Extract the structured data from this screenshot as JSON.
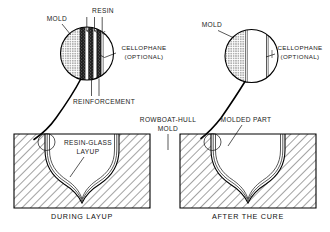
{
  "figure": {
    "panels": [
      {
        "id": "during-layup",
        "caption": "DURING LAYUP",
        "callouts": [
          {
            "name": "mold",
            "text": "MOLD"
          },
          {
            "name": "resin",
            "text": "RESIN"
          },
          {
            "name": "cellophane",
            "line1": "CELLOPHANE",
            "line2": "(OPTIONAL)"
          },
          {
            "name": "reinforcement",
            "text": "REINFORCEMENT"
          },
          {
            "name": "resin-glass-layup",
            "line1": "RESIN-GLASS",
            "line2": "LAYUP"
          }
        ],
        "detail_layers": [
          "mold",
          "reinforcement",
          "resin",
          "reinforcement",
          "resin",
          "cellophane"
        ],
        "resin_arrow_count": 3
      },
      {
        "id": "after-the-cure",
        "caption": "AFTER THE CURE",
        "callouts": [
          {
            "name": "mold",
            "text": "MOLD"
          },
          {
            "name": "cellophane",
            "line1": "CELLOPHANE",
            "line2": "(OPTIONAL)"
          },
          {
            "name": "molded-part",
            "text": "MOLDED PART"
          },
          {
            "name": "rowboat-hull-mold",
            "line1": "ROWBOAT-HULL",
            "line2": "MOLD"
          }
        ],
        "detail_layers": [
          "mold",
          "molded-part",
          "cellophane"
        ]
      }
    ]
  },
  "colors": {
    "ink": "#111111",
    "paper": "#ffffff",
    "hatch": "#333333",
    "layer_dark": "#1a1a1a"
  }
}
